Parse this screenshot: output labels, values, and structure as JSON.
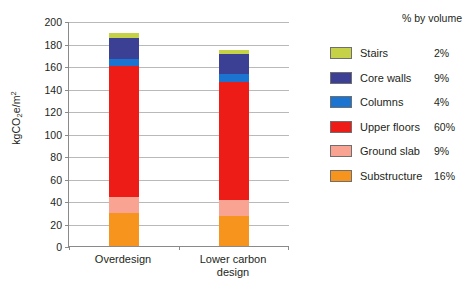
{
  "chart_data": {
    "type": "bar",
    "title": "",
    "subtitle": "",
    "stacked": true,
    "xlabel": "",
    "ylabel": "kgCO2e/m2",
    "ylabel_display": "kgCO₂e/m²",
    "ylim": [
      0,
      200
    ],
    "ytick_step": 20,
    "ytick_labels": [
      "200",
      "180",
      "160",
      "140",
      "120",
      "100",
      "80",
      "60",
      "40",
      "20",
      "0"
    ],
    "ytick_values": [
      200,
      180,
      160,
      140,
      120,
      100,
      80,
      60,
      40,
      20,
      0
    ],
    "grid": true,
    "grid_axis": "y",
    "legend_position": "right",
    "legend_header": "% by volume",
    "categories": [
      "Overdesign",
      "Lower carbon design"
    ],
    "category_labels": [
      {
        "line1": "Overdesign",
        "line2": ""
      },
      {
        "line1": "Lower carbon",
        "line2": "design"
      }
    ],
    "series": [
      {
        "name": "Substructure",
        "color": "#f7941e",
        "percent_by_volume": "16%",
        "values": [
          29,
          27
        ]
      },
      {
        "name": "Ground slab",
        "color": "#f9a392",
        "percent_by_volume": "9%",
        "values": [
          15,
          14
        ]
      },
      {
        "name": "Upper floors",
        "color": "#ed1c16",
        "percent_by_volume": "60%",
        "values": [
          116,
          105
        ]
      },
      {
        "name": "Columns",
        "color": "#1b75d0",
        "percent_by_volume": "4%",
        "values": [
          6,
          7
        ]
      },
      {
        "name": "Core walls",
        "color": "#3b4095",
        "percent_by_volume": "9%",
        "values": [
          19,
          18
        ]
      },
      {
        "name": "Stairs",
        "color": "#c5d147",
        "percent_by_volume": "2%",
        "values": [
          4,
          3
        ]
      }
    ],
    "totals": [
      189,
      174
    ],
    "legend_order": [
      "Stairs",
      "Core walls",
      "Columns",
      "Upper floors",
      "Ground slab",
      "Substructure"
    ]
  },
  "caption": {
    "text": ""
  }
}
